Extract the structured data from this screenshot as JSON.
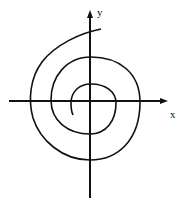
{
  "diagram": {
    "type": "spiral-on-axes",
    "axes": {
      "x_label": "x",
      "y_label": "y"
    },
    "curve": "spiral",
    "colors": {
      "stroke": "#111111",
      "background": "#ffffff"
    }
  }
}
